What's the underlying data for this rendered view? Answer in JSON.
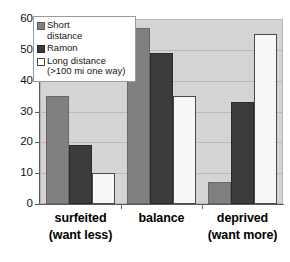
{
  "chart_data": {
    "type": "bar",
    "title": "",
    "xlabel": "",
    "ylabel": "",
    "ylim": [
      0,
      60
    ],
    "yticks": [
      0,
      10,
      20,
      30,
      40,
      50,
      60
    ],
    "grid": true,
    "legend_position": "top-left-overlay",
    "categories": [
      "surfeited\n(want less)",
      "balance",
      "deprived\n(want more)"
    ],
    "category_lines": [
      [
        "surfeited",
        "(want less)"
      ],
      [
        "balance",
        ""
      ],
      [
        "deprived",
        "(want more)"
      ]
    ],
    "series": [
      {
        "name": "Short distance",
        "name_lines": [
          "Short",
          "distance"
        ],
        "color": "#808080",
        "values": [
          35,
          57,
          7
        ]
      },
      {
        "name": "Ramon",
        "name_lines": [
          "Ramon"
        ],
        "color": "#3b3b3b",
        "values": [
          19,
          49,
          33
        ]
      },
      {
        "name": "Long distance (>100 mi one way)",
        "name_lines": [
          "Long distance",
          "(>100 mi one way)"
        ],
        "color": "#f7f7f7",
        "values": [
          10,
          35,
          55
        ]
      }
    ]
  },
  "axis": {
    "ytick_labels": [
      "60",
      "50",
      "40",
      "30",
      "20",
      "10",
      "0"
    ]
  },
  "legend": {
    "entries": [
      "Short\ndistance",
      "Ramon",
      "Long distance\n(>100 mi one way)"
    ]
  },
  "colors": {
    "plot_background": "#d4d4d4",
    "page_background": "#ffffff",
    "gridline": "#b9b9b9",
    "axis": "#5a5a5a",
    "series_1": "#808080",
    "series_2": "#3b3b3b",
    "series_3": "#f7f7f7"
  }
}
